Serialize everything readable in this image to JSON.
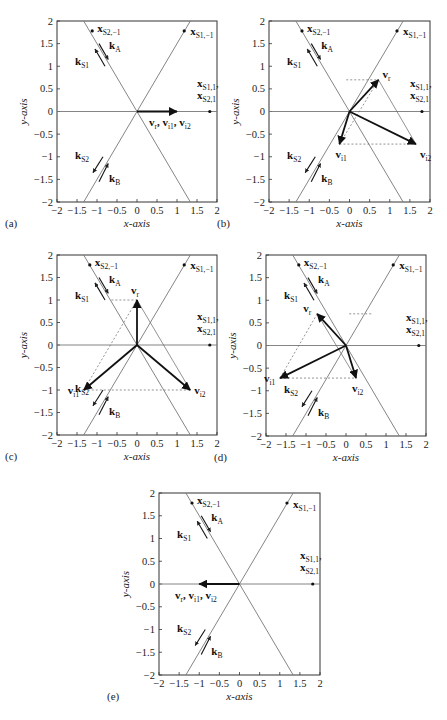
{
  "figure": {
    "axis": {
      "xlabel": "x-axis",
      "ylabel": "y-axis",
      "xlim": [
        -2,
        2
      ],
      "ylim": [
        -2,
        2
      ],
      "xticks": [
        "-2",
        "-1.5",
        "-1",
        "-0.5",
        "0",
        "0.5",
        "1",
        "1.5",
        "2"
      ],
      "yticks": [
        "2",
        "1.5",
        "1",
        "0.5",
        "0",
        "-0.5",
        "-1",
        "-1.5",
        "-2"
      ]
    },
    "labels": {
      "xS2m1": {
        "main": "x",
        "sub": "S2,−1"
      },
      "xS1m1": {
        "main": "x",
        "sub": "S1,−1"
      },
      "xS11": {
        "main": "x",
        "sub": "S1,1",
        "suffix": ","
      },
      "xS21": {
        "main": "x",
        "sub": "S2,1"
      },
      "kA": {
        "main": "k",
        "sub": "A"
      },
      "kS1": {
        "main": "k",
        "sub": "S1"
      },
      "kS2": {
        "main": "k",
        "sub": "S2"
      },
      "kB": {
        "main": "k",
        "sub": "B"
      },
      "vr": {
        "main": "v",
        "sub": "r"
      },
      "vi1": {
        "main": "v",
        "sub": "i1"
      },
      "vi2": {
        "main": "v",
        "sub": "i2"
      },
      "combined": "v_r, v_i1, v_i2"
    }
  },
  "chart_data": [
    {
      "type": "line",
      "panel": "(a)",
      "title": "",
      "xlabel": "x-axis",
      "ylabel": "y-axis",
      "xlim": [
        -2,
        2
      ],
      "ylim": [
        -2,
        2
      ],
      "lines": [
        {
          "name": "line S2 (k_A/k_S1 direction)",
          "slope": -1.5
        },
        {
          "name": "line S1",
          "slope": 1.5
        },
        {
          "name": "x-axis S1,1/S2,1",
          "slope": 0
        }
      ],
      "points": {
        "x_S2,-1": [
          -1.12,
          1.78
        ],
        "x_S1,-1": [
          1.18,
          1.78
        ],
        "x_S1,1/x_S2,1": [
          1.82,
          0
        ]
      },
      "vectors": {
        "v_r": [
          1.0,
          0
        ],
        "v_i1": [
          1.0,
          0
        ],
        "v_i2": [
          1.0,
          0
        ]
      },
      "annotation": "v_r, v_i1, v_i2"
    },
    {
      "type": "line",
      "panel": "(b)",
      "xlabel": "x-axis",
      "ylabel": "y-axis",
      "xlim": [
        -2,
        2
      ],
      "ylim": [
        -2,
        2
      ],
      "points": {
        "x_S2,-1": [
          -1.18,
          1.78
        ],
        "x_S1,-1": [
          1.18,
          1.78
        ],
        "x_S1,1/x_S2,1": [
          1.8,
          0
        ]
      },
      "vectors": {
        "v_r": [
          0.72,
          0.7
        ],
        "v_i1": [
          -0.25,
          -0.72
        ],
        "v_i2": [
          1.65,
          -0.72
        ]
      }
    },
    {
      "type": "line",
      "panel": "(c)",
      "xlabel": "x-axis",
      "ylabel": "y-axis",
      "xlim": [
        -2,
        2
      ],
      "ylim": [
        -2,
        2
      ],
      "points": {
        "x_S2,-1": [
          -1.18,
          1.78
        ],
        "x_S1,-1": [
          1.18,
          1.78
        ],
        "x_S1,1/x_S2,1": [
          1.82,
          0
        ]
      },
      "vectors": {
        "v_r": [
          0,
          1.0
        ],
        "v_i1": [
          -1.33,
          -1.0
        ],
        "v_i2": [
          1.33,
          -1.0
        ]
      }
    },
    {
      "type": "line",
      "panel": "(d)",
      "xlabel": "x-axis",
      "ylabel": "y-axis",
      "xlim": [
        -2,
        2
      ],
      "ylim": [
        -2,
        2
      ],
      "points": {
        "x_S2,-1": [
          -1.18,
          1.78
        ],
        "x_S1,-1": [
          1.18,
          1.78
        ],
        "x_S1,1/x_S2,1": [
          1.82,
          0
        ]
      },
      "vectors": {
        "v_r": [
          -0.72,
          0.7
        ],
        "v_i1": [
          -1.65,
          -0.72
        ],
        "v_i2": [
          0.25,
          -0.72
        ]
      }
    },
    {
      "type": "line",
      "panel": "(e)",
      "xlabel": "x-axis",
      "ylabel": "y-axis",
      "xlim": [
        -2,
        2
      ],
      "ylim": [
        -2,
        2
      ],
      "points": {
        "x_S2,-1": [
          -1.18,
          1.78
        ],
        "x_S1,-1": [
          1.18,
          1.78
        ],
        "x_S1,1/x_S2,1": [
          1.82,
          0
        ]
      },
      "vectors": {
        "v_r": [
          -1.0,
          0
        ],
        "v_i1": [
          -1.0,
          0
        ],
        "v_i2": [
          -1.0,
          0
        ]
      },
      "annotation": "v_r, v_i1, v_i2"
    }
  ],
  "panels": [
    {
      "id": "a",
      "label": "(a)",
      "frame": [
        57,
        21,
        217,
        202
      ],
      "combined": "right"
    },
    {
      "id": "b",
      "label": "(b)",
      "frame": [
        269,
        21,
        430,
        202
      ]
    },
    {
      "id": "c",
      "label": "(c)",
      "frame": [
        57,
        255,
        217,
        435
      ]
    },
    {
      "id": "d",
      "label": "(d)",
      "frame": [
        266,
        255,
        426,
        436
      ]
    },
    {
      "id": "e",
      "label": "(e)",
      "frame": [
        159,
        493,
        320,
        675
      ],
      "combined": "left"
    }
  ]
}
